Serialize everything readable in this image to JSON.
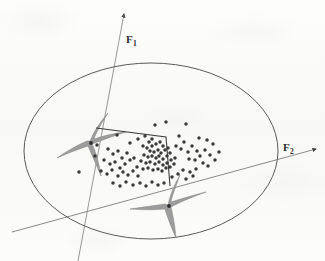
{
  "figure": {
    "title": "",
    "background_color": "#fbfbfa",
    "axes": [
      {
        "name": "F1",
        "label": "F",
        "subscript": "1",
        "orientation": "near-vertical",
        "has_arrowhead": true
      },
      {
        "name": "F2",
        "label": "F",
        "subscript": "2",
        "orientation": "near-horizontal",
        "has_arrowhead": true
      }
    ],
    "colors": {
      "ink": "#4a4a4a",
      "point": "#3a3a3a",
      "star_fill": "#9a9a9a",
      "star_stroke": "#7d7d7d",
      "ellipse_stroke": "#555555",
      "axis_stroke": "#8a8a8a",
      "polyline_stroke": "#3d3d3d"
    }
  },
  "chart_data": {
    "type": "scatter",
    "title": "",
    "xlabel": "F2",
    "ylabel": "F1",
    "grid": false,
    "legend": null,
    "xlim": [
      0,
      325
    ],
    "ylim": [
      0,
      261
    ],
    "annotations": [
      {
        "name": "boundary-ellipse",
        "shape": "ellipse",
        "cx": 151,
        "cy": 151,
        "rx": 127,
        "ry": 88,
        "rotation": 0
      },
      {
        "name": "axis-f1-line",
        "shape": "line",
        "x1": 124,
        "y1": 13,
        "x2": 78,
        "y2": 261
      },
      {
        "name": "axis-f2-line",
        "shape": "line",
        "x1": 12,
        "y1": 232,
        "x2": 318,
        "y2": 148
      },
      {
        "name": "star-left",
        "shape": "concave-star",
        "cx": 90,
        "cy": 141,
        "note": "grey four-point concave star marking a cluster centroid"
      },
      {
        "name": "star-bottom",
        "shape": "concave-star",
        "cx": 168,
        "cy": 205,
        "note": "grey four-point concave star marking a cluster centroid"
      },
      {
        "name": "link-polyline",
        "shape": "polyline",
        "points": "96,128 166,137 170,186"
      }
    ],
    "series": [
      {
        "name": "data-points",
        "marker": "filled-circle",
        "color": "#3a3a3a",
        "count": 104,
        "points": [
          [
            155,
            125
          ],
          [
            166,
            122
          ],
          [
            186,
            124
          ],
          [
            117,
            135
          ],
          [
            130,
            143
          ],
          [
            138,
            139
          ],
          [
            145,
            136
          ],
          [
            149,
            142
          ],
          [
            152,
            139
          ],
          [
            143,
            146
          ],
          [
            147,
            148
          ],
          [
            152,
            146
          ],
          [
            156,
            144
          ],
          [
            160,
            142
          ],
          [
            163,
            146
          ],
          [
            150,
            151
          ],
          [
            154,
            152
          ],
          [
            158,
            150
          ],
          [
            161,
            153
          ],
          [
            165,
            150
          ],
          [
            168,
            148
          ],
          [
            144,
            155
          ],
          [
            148,
            157
          ],
          [
            152,
            156
          ],
          [
            156,
            158
          ],
          [
            159,
            156
          ],
          [
            163,
            159
          ],
          [
            167,
            156
          ],
          [
            170,
            153
          ],
          [
            141,
            161
          ],
          [
            146,
            163
          ],
          [
            150,
            162
          ],
          [
            155,
            164
          ],
          [
            159,
            162
          ],
          [
            163,
            165
          ],
          [
            167,
            163
          ],
          [
            171,
            160
          ],
          [
            175,
            158
          ],
          [
            137,
            167
          ],
          [
            143,
            169
          ],
          [
            148,
            168
          ],
          [
            153,
            170
          ],
          [
            158,
            169
          ],
          [
            162,
            171
          ],
          [
            166,
            168
          ],
          [
            170,
            167
          ],
          [
            174,
            164
          ],
          [
            108,
            149
          ],
          [
            113,
            154
          ],
          [
            118,
            151
          ],
          [
            122,
            158
          ],
          [
            127,
            153
          ],
          [
            104,
            160
          ],
          [
            110,
            164
          ],
          [
            115,
            162
          ],
          [
            120,
            168
          ],
          [
            125,
            164
          ],
          [
            130,
            160
          ],
          [
            134,
            158
          ],
          [
            101,
            171
          ],
          [
            107,
            174
          ],
          [
            112,
            170
          ],
          [
            118,
            176
          ],
          [
            123,
            172
          ],
          [
            128,
            175
          ],
          [
            133,
            171
          ],
          [
            138,
            176
          ],
          [
            113,
            183
          ],
          [
            120,
            186
          ],
          [
            126,
            182
          ],
          [
            133,
            185
          ],
          [
            140,
            183
          ],
          [
            146,
            186
          ],
          [
            152,
            182
          ],
          [
            158,
            185
          ],
          [
            164,
            183
          ],
          [
            79,
            172
          ],
          [
            97,
            145
          ],
          [
            95,
            156
          ],
          [
            179,
            136
          ],
          [
            184,
            142
          ],
          [
            181,
            149
          ],
          [
            188,
            152
          ],
          [
            176,
            146
          ],
          [
            192,
            146
          ],
          [
            197,
            151
          ],
          [
            189,
            159
          ],
          [
            195,
            160
          ],
          [
            200,
            156
          ],
          [
            205,
            150
          ],
          [
            210,
            155
          ],
          [
            203,
            163
          ],
          [
            208,
            166
          ],
          [
            196,
            169
          ],
          [
            190,
            172
          ],
          [
            183,
            170
          ],
          [
            178,
            174
          ],
          [
            172,
            177
          ],
          [
            186,
            179
          ],
          [
            193,
            176
          ],
          [
            215,
            160
          ],
          [
            219,
            152
          ],
          [
            213,
            144
          ],
          [
            207,
            140
          ],
          [
            199,
            138
          ]
        ]
      }
    ]
  }
}
